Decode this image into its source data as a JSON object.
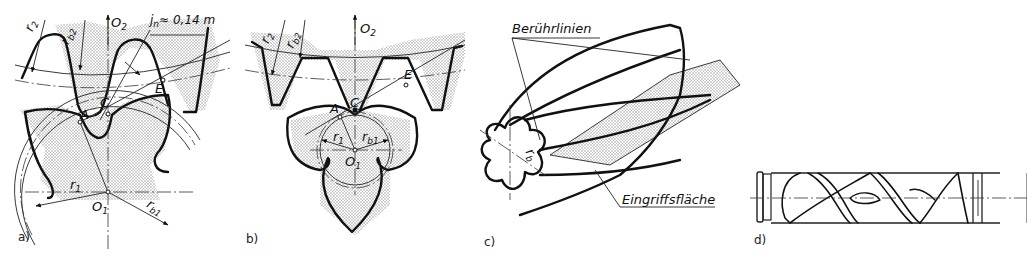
{
  "figure": {
    "colors": {
      "line": "#111111",
      "shading": "#9a9a9a",
      "background": "#ffffff"
    }
  },
  "panels": [
    {
      "id": "a",
      "caption": "a)",
      "labels": {
        "r2": "r",
        "r2_sub": "2",
        "rb2": "r",
        "rb2_sub": "b2",
        "O2": "O",
        "O2_sub": "2",
        "jn": "j",
        "jn_sub": "n",
        "jn_value": "≈ 0,14 m",
        "C": "C",
        "A": "A",
        "E": "E",
        "r1": "r",
        "r1_sub": "1",
        "O1": "O",
        "O1_sub": "1",
        "rb1": "r",
        "rb1_sub": "b1"
      }
    },
    {
      "id": "b",
      "caption": "b)",
      "labels": {
        "r2": "r",
        "r2_sub": "2",
        "rb2": "r",
        "rb2_sub": "b2",
        "O2": "O",
        "O2_sub": "2",
        "C": "C",
        "A": "A",
        "E": "E",
        "r1": "r",
        "r1_sub": "1",
        "rb1": "r",
        "rb1_sub": "b1",
        "O1": "O",
        "O1_sub": "1"
      }
    },
    {
      "id": "c",
      "caption": "c)",
      "labels": {
        "contact_lines": "Berührlinien",
        "rb": "r",
        "rb_sub": "b",
        "engagement_surface": "Eingriffsfläche"
      }
    },
    {
      "id": "d",
      "caption": "d)",
      "labels": {}
    }
  ]
}
